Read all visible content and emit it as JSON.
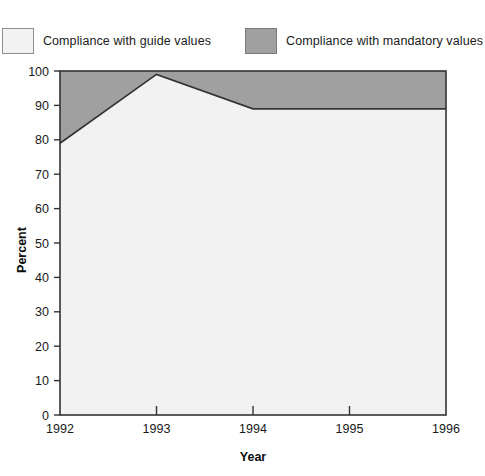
{
  "chart_data": {
    "type": "area",
    "title": "",
    "xlabel": "Year",
    "ylabel": "Percent",
    "categories": [
      "1992",
      "1993",
      "1994",
      "1995",
      "1996"
    ],
    "x": [
      1992,
      1993,
      1994,
      1995,
      1996
    ],
    "xlim": [
      1992,
      1996
    ],
    "ylim": [
      0,
      100
    ],
    "yticks": [
      0,
      10,
      20,
      30,
      40,
      50,
      60,
      70,
      80,
      90,
      100
    ],
    "ytick_labels": [
      "0",
      "10",
      "20",
      "30",
      "40",
      "50",
      "60",
      "70",
      "80",
      "90",
      "100"
    ],
    "xticks": [
      1992,
      1993,
      1994,
      1995,
      1996
    ],
    "xtick_labels": [
      "1992",
      "1993",
      "1994",
      "1995",
      "1996"
    ],
    "grid": false,
    "stacked": true,
    "legend_position": "top",
    "series": [
      {
        "name": "Compliance with guide values",
        "values": [
          79,
          99,
          89,
          89,
          89
        ],
        "color": "#f2f2f2"
      },
      {
        "name": "Compliance with mandatory values",
        "values": [
          21,
          1,
          11,
          11,
          11
        ],
        "color": "#a0a0a0"
      }
    ],
    "colors": {
      "guide_fill": "#f2f2f2",
      "mandatory_fill": "#a0a0a0",
      "axis": "#333333",
      "boundary_line": "#333333"
    }
  },
  "legend": {
    "entries": [
      {
        "label": "Compliance with guide values",
        "swatch": "light-swatch"
      },
      {
        "label": "Compliance with mandatory values",
        "swatch": "gray-swatch"
      }
    ]
  },
  "axes": {
    "y_title": "Percent",
    "x_title": "Year",
    "y_labels": [
      "100",
      "90",
      "80",
      "70",
      "60",
      "50",
      "40",
      "30",
      "20",
      "10",
      "0"
    ],
    "x_labels": [
      "1992",
      "1993",
      "1994",
      "1995",
      "1996"
    ]
  }
}
